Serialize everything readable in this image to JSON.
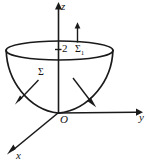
{
  "figure": {
    "type": "3d-coordinate-diagram",
    "background_color": "#ffffff",
    "ink_color": "#1a1a1a",
    "axes": [
      {
        "id": "z",
        "label": "z",
        "direction": "up",
        "arrow": true
      },
      {
        "id": "y",
        "label": "y",
        "direction": "right",
        "arrow": true
      },
      {
        "id": "x",
        "label": "x",
        "direction": "down-left",
        "arrow": true
      }
    ],
    "origin_label": "O",
    "tick_labels": [
      {
        "axis": "z",
        "value": "2"
      }
    ],
    "surface_labels": [
      {
        "id": "sigma",
        "base": "Σ",
        "subscript": ""
      },
      {
        "id": "sigma1",
        "base": "Σ",
        "subscript": "1"
      }
    ],
    "normals": [
      {
        "id": "cap-normal",
        "orientation": "upward",
        "attached_to": "sigma1"
      },
      {
        "id": "left-normal",
        "orientation": "down-left-outward",
        "attached_to": "sigma"
      },
      {
        "id": "right-normal",
        "orientation": "down-right-outward",
        "attached_to": "sigma"
      }
    ]
  }
}
